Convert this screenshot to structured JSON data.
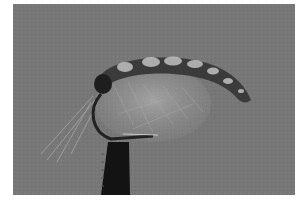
{
  "image": {
    "subject": "fly-fishing-fly-in-vise",
    "background_color": "#777777",
    "border_color": "#ffffff",
    "body_color": "#3a3a3a",
    "segment_highlight_color": "#bdbdbd",
    "vise_color": "#141414",
    "hackle_color": "#9a9a9a"
  }
}
